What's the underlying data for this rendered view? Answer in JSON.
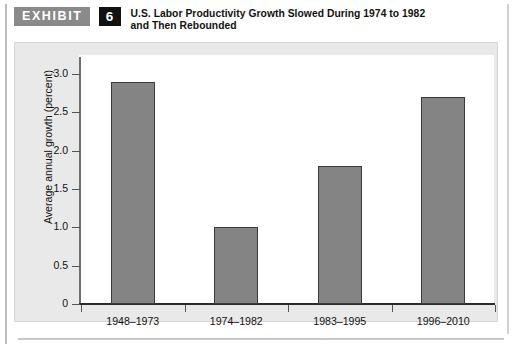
{
  "exhibit": {
    "badge_label": "EXHIBIT",
    "number": "6",
    "title_line1": "U.S. Labor Productivity Growth Slowed During 1974 to 1982",
    "title_line2": "and Then Rebounded"
  },
  "colors": {
    "badge_gray": "#8a8a8a",
    "badge_black": "#111111",
    "panel_background": "#e9e9e9",
    "plot_background": "#ffffff",
    "bar_fill": "#848484",
    "bar_edge": "#3a3a3a",
    "axis": "#2b2b2b"
  },
  "chart_data": {
    "type": "bar",
    "title": "U.S. Labor Productivity Growth Slowed During 1974 to 1982 and Then Rebounded",
    "categories": [
      "1948–1973",
      "1974–1982",
      "1983–1995",
      "1996–2010"
    ],
    "values": [
      2.9,
      1.0,
      1.8,
      2.7
    ],
    "xlabel": "",
    "ylabel": "Average annual growth (percent)",
    "ylim": [
      0,
      3.25
    ],
    "yticks": [
      0,
      0.5,
      1.0,
      1.5,
      2.0,
      2.5,
      3.0
    ],
    "ytick_labels": [
      "0",
      "0.5",
      "1.0",
      "1.5",
      "2.0",
      "2.5",
      "3.0"
    ],
    "grid": false,
    "legend": null
  }
}
